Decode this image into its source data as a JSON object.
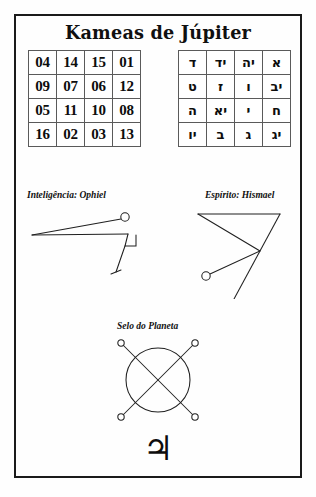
{
  "page": {
    "title": "Kameas de Júpiter",
    "planet_glyph": "♃",
    "planet_glyph_name": "jupiter-symbol"
  },
  "kamea_numbers": {
    "caption": "Kamea de Júpiter",
    "rows": [
      [
        "04",
        "14",
        "15",
        "01"
      ],
      [
        "09",
        "07",
        "06",
        "12"
      ],
      [
        "05",
        "11",
        "10",
        "08"
      ],
      [
        "16",
        "02",
        "03",
        "13"
      ]
    ]
  },
  "kamea_hebrew": {
    "caption": "Kamea em hebraico",
    "rows": [
      [
        "ד",
        "יד",
        "יה",
        "א"
      ],
      [
        "ט",
        "ז",
        "ו",
        "יב"
      ],
      [
        "ה",
        "יא",
        "י",
        "ח"
      ],
      [
        "יו",
        "ב",
        "ג",
        "יג"
      ]
    ]
  },
  "sigils": {
    "intelligence_label": "Inteligência: Ophiel",
    "spirit_label": "Espírito: Hismael",
    "seal_label": "Selo do Planeta"
  }
}
